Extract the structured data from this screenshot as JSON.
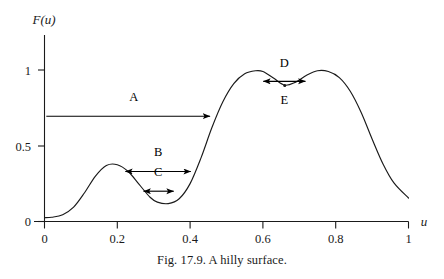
{
  "figure": {
    "caption": "Fig. 17.9.  A hilly surface.",
    "y_axis_title": "F(u)",
    "x_axis_title": "u"
  },
  "chart_data": {
    "type": "line",
    "title": "A hilly surface.",
    "xlabel": "u",
    "ylabel": "F(u)",
    "xlim": [
      0,
      1
    ],
    "ylim": [
      0,
      1.08
    ],
    "grid": false,
    "legend": "none",
    "xticks": [
      0,
      0.2,
      0.4,
      0.6,
      0.8,
      1
    ],
    "xtick_labels": [
      "0",
      "0.2",
      "0.4",
      "0.6",
      "0.8",
      "1"
    ],
    "yticks": [
      0,
      0.5,
      1
    ],
    "ytick_labels": [
      "0",
      "0.5",
      "1"
    ],
    "series": [
      {
        "name": "F(u)",
        "x": [
          0.0,
          0.02,
          0.05,
          0.08,
          0.11,
          0.14,
          0.17,
          0.2,
          0.23,
          0.26,
          0.29,
          0.31,
          0.34,
          0.37,
          0.4,
          0.43,
          0.46,
          0.49,
          0.52,
          0.55,
          0.58,
          0.6,
          0.63,
          0.66,
          0.69,
          0.72,
          0.75,
          0.78,
          0.81,
          0.84,
          0.87,
          0.9,
          0.93,
          0.96,
          1.0
        ],
        "y": [
          0.025,
          0.028,
          0.045,
          0.095,
          0.19,
          0.3,
          0.37,
          0.375,
          0.33,
          0.245,
          0.16,
          0.128,
          0.118,
          0.15,
          0.25,
          0.42,
          0.62,
          0.79,
          0.91,
          0.975,
          0.995,
          0.99,
          0.945,
          0.9,
          0.92,
          0.965,
          0.995,
          0.99,
          0.95,
          0.86,
          0.72,
          0.545,
          0.38,
          0.255,
          0.155
        ]
      }
    ],
    "annotations": [
      {
        "label": "A",
        "kind": "arrow-right",
        "y_value": 0.695,
        "x_start": 0.005,
        "x_end": 0.455,
        "label_x": 0.245,
        "label_y": 0.795
      },
      {
        "label": "B",
        "kind": "arrow-double",
        "y_value": 0.33,
        "x_start": 0.222,
        "x_end": 0.402,
        "label_x": 0.312,
        "label_y": 0.43
      },
      {
        "label": "C",
        "kind": "arrow-double",
        "y_value": 0.2,
        "x_start": 0.272,
        "x_end": 0.355,
        "label_x": 0.312,
        "label_y": 0.3
      },
      {
        "label": "D",
        "kind": "arrow-double",
        "y_value": 0.925,
        "x_start": 0.601,
        "x_end": 0.717,
        "label_x": 0.659,
        "label_y": 1.02
      },
      {
        "label": "E",
        "kind": "point-label",
        "point_x": 0.66,
        "point_y": 0.898,
        "label_x": 0.659,
        "label_y": 0.775
      }
    ]
  }
}
